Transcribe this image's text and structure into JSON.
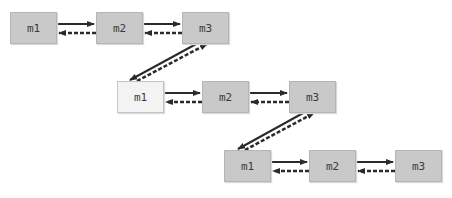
{
  "diagram": {
    "rows": [
      {
        "nodes": [
          {
            "label": "m1",
            "x": 10,
            "y": 12,
            "highlight": false
          },
          {
            "label": "m2",
            "x": 96,
            "y": 12,
            "highlight": false
          },
          {
            "label": "m3",
            "x": 182,
            "y": 12,
            "highlight": false
          }
        ]
      },
      {
        "nodes": [
          {
            "label": "m1",
            "x": 117,
            "y": 81,
            "highlight": true
          },
          {
            "label": "m2",
            "x": 202,
            "y": 81,
            "highlight": false
          },
          {
            "label": "m3",
            "x": 289,
            "y": 81,
            "highlight": false
          }
        ]
      },
      {
        "nodes": [
          {
            "label": "m1",
            "x": 224,
            "y": 150,
            "highlight": false
          },
          {
            "label": "m2",
            "x": 309,
            "y": 150,
            "highlight": false
          },
          {
            "label": "m3",
            "x": 395,
            "y": 150,
            "highlight": false
          }
        ]
      }
    ],
    "edge_styles": {
      "forward": "solid-arrow",
      "backward": "dashed-arrow"
    },
    "colors": {
      "node_fill": "#c9c9c9",
      "node_highlight_fill": "#f3f3f3",
      "arrow": "#2a2a2a"
    }
  }
}
